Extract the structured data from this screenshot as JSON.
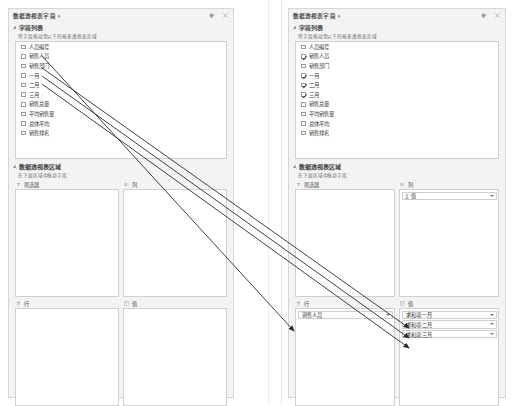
{
  "panels": {
    "before": {
      "title": "数据透视表字段",
      "title_caret": "▾",
      "icons": {
        "settings": "gear-icon",
        "close": "close-icon"
      },
      "field_section": {
        "label": "字段列表",
        "hint": "将字段拖动至以下的报表透视表区域",
        "fields": [
          {
            "name": "人员编号",
            "checked": false
          },
          {
            "name": "销售人员",
            "checked": false
          },
          {
            "name": "销售部门",
            "checked": false
          },
          {
            "name": "一月",
            "checked": false
          },
          {
            "name": "二月",
            "checked": false
          },
          {
            "name": "三月",
            "checked": false
          },
          {
            "name": "销售总量",
            "checked": false
          },
          {
            "name": "平均销售量",
            "checked": false
          },
          {
            "name": "总体平均",
            "checked": false
          },
          {
            "name": "销售排名",
            "checked": false
          }
        ]
      },
      "areas_section": {
        "label": "数据透视表区域",
        "hint": "在下面区域中拖动字段",
        "areas": [
          {
            "key": "filters",
            "title": "筛选器",
            "icon": "filter-icon",
            "items": []
          },
          {
            "key": "columns",
            "title": "列",
            "icon": "columns-icon",
            "items": []
          },
          {
            "key": "rows",
            "title": "行",
            "icon": "rows-icon",
            "items": []
          },
          {
            "key": "values",
            "title": "值",
            "icon": "values-icon",
            "items": []
          }
        ]
      }
    },
    "after": {
      "title": "数据透视表字段",
      "title_caret": "▾",
      "icons": {
        "settings": "gear-icon",
        "close": "close-icon"
      },
      "field_section": {
        "label": "字段列表",
        "hint": "将字段拖动至以下的报表透视表区域",
        "fields": [
          {
            "name": "人员编号",
            "checked": false
          },
          {
            "name": "销售人员",
            "checked": true
          },
          {
            "name": "销售部门",
            "checked": false
          },
          {
            "name": "一月",
            "checked": true
          },
          {
            "name": "二月",
            "checked": true
          },
          {
            "name": "三月",
            "checked": true
          },
          {
            "name": "销售总量",
            "checked": false
          },
          {
            "name": "平均销售量",
            "checked": false
          },
          {
            "name": "总体平均",
            "checked": false
          },
          {
            "name": "销售排名",
            "checked": false
          }
        ]
      },
      "areas_section": {
        "label": "数据透视表区域",
        "hint": "在下面区域中拖动字段",
        "areas": [
          {
            "key": "filters",
            "title": "筛选器",
            "icon": "filter-icon",
            "items": []
          },
          {
            "key": "columns",
            "title": "列",
            "icon": "columns-icon",
            "items": [
              {
                "label": "∑ 值"
              }
            ]
          },
          {
            "key": "rows",
            "title": "行",
            "icon": "rows-icon",
            "items": [
              {
                "label": "销售人员"
              }
            ]
          },
          {
            "key": "values",
            "title": "值",
            "icon": "values-icon",
            "items": [
              {
                "label": "求和项:一月"
              },
              {
                "label": "求和项:二月"
              },
              {
                "label": "求和项:三月"
              }
            ]
          }
        ]
      }
    }
  },
  "annotations": {
    "arrow_color": "#2b2b2b",
    "arrows": [
      {
        "name": "arrow-sales-person-to-rows",
        "from": [
          42,
          56
        ],
        "to": [
          294,
          331
        ]
      },
      {
        "name": "arrow-january-to-values",
        "from": [
          42,
          68
        ],
        "to": [
          409,
          328
        ]
      },
      {
        "name": "arrow-february-to-values",
        "from": [
          42,
          76
        ],
        "to": [
          409,
          338
        ]
      },
      {
        "name": "arrow-march-to-values",
        "from": [
          42,
          84
        ],
        "to": [
          409,
          348
        ]
      }
    ]
  }
}
